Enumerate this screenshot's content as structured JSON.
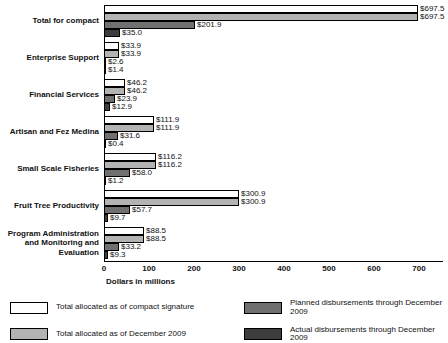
{
  "chart_data": {
    "type": "bar",
    "orientation": "horizontal",
    "title": "",
    "xlabel": "Dollars in millions",
    "xlim": [
      0,
      700
    ],
    "xticks": [
      0,
      100,
      200,
      300,
      400,
      500,
      600,
      700
    ],
    "xtick_labels": [
      "0",
      "100",
      "200",
      "300",
      "400",
      "500",
      "600",
      "700"
    ],
    "grid": false,
    "legend_position": "bottom",
    "categories": [
      "Total for compact",
      "Enterprise Support",
      "Financial Services",
      "Artisan and Fez Medina",
      "Small Scale Fisheries",
      "Fruit Tree Productivity",
      "Program Administration and Monitoring and Evaluation"
    ],
    "series": [
      {
        "name": "Total allocated as of compact signature",
        "color": "#ffffff",
        "values": [
          697.5,
          33.9,
          46.2,
          111.9,
          116.2,
          300.9,
          88.5
        ],
        "value_labels": [
          "$697.5",
          "$33.9",
          "$46.2",
          "$111.9",
          "$116.2",
          "$300.9",
          "$88.5"
        ]
      },
      {
        "name": "Total allocated as of December 2009",
        "color": "#b3b3b3",
        "values": [
          697.5,
          33.9,
          46.2,
          111.9,
          116.2,
          300.9,
          88.5
        ],
        "value_labels": [
          "$697.5",
          "$33.9",
          "$46.2",
          "$111.9",
          "$116.2",
          "$300.9",
          "$88.5"
        ]
      },
      {
        "name": "Planned disbursements through December 2009",
        "color": "#707070",
        "values": [
          201.9,
          2.6,
          23.9,
          31.6,
          58.0,
          57.7,
          33.2
        ],
        "value_labels": [
          "$201.9",
          "$2.6",
          "$23.9",
          "$31.6",
          "$58.0",
          "$57.7",
          "$33.2"
        ]
      },
      {
        "name": "Actual disbursements through December 2009",
        "color": "#3d3d3d",
        "values": [
          35.0,
          1.4,
          12.9,
          0.4,
          1.2,
          9.7,
          9.3
        ],
        "value_labels": [
          "$35.0",
          "$1.4",
          "$12.9",
          "$0.4",
          "$1.2",
          "$9.7",
          "$9.3"
        ]
      }
    ],
    "legend_order": [
      0,
      2,
      1,
      3
    ]
  }
}
